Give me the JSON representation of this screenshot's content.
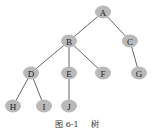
{
  "diagram": {
    "type": "tree",
    "colors": {
      "node_fill": "#b9b9b9",
      "edge": "#555555",
      "label": "#222222"
    },
    "nodes": [
      {
        "id": "A",
        "label": "A",
        "x": 103,
        "y": 12
      },
      {
        "id": "B",
        "label": "B",
        "x": 69,
        "y": 41
      },
      {
        "id": "C",
        "label": "C",
        "x": 130,
        "y": 41
      },
      {
        "id": "D",
        "label": "D",
        "x": 31,
        "y": 73
      },
      {
        "id": "E",
        "label": "E",
        "x": 69,
        "y": 73
      },
      {
        "id": "F",
        "label": "F",
        "x": 103,
        "y": 73
      },
      {
        "id": "G",
        "label": "G",
        "x": 139,
        "y": 73
      },
      {
        "id": "H",
        "label": "H",
        "x": 13,
        "y": 106
      },
      {
        "id": "I",
        "label": "I",
        "x": 44,
        "y": 106
      },
      {
        "id": "J",
        "label": "J",
        "x": 69,
        "y": 106
      }
    ],
    "edges": [
      [
        "A",
        "B"
      ],
      [
        "A",
        "C"
      ],
      [
        "B",
        "D"
      ],
      [
        "B",
        "E"
      ],
      [
        "B",
        "F"
      ],
      [
        "C",
        "G"
      ],
      [
        "D",
        "H"
      ],
      [
        "D",
        "I"
      ],
      [
        "E",
        "J"
      ]
    ]
  },
  "caption": {
    "figure_number": "图 6-1",
    "title": "树"
  }
}
